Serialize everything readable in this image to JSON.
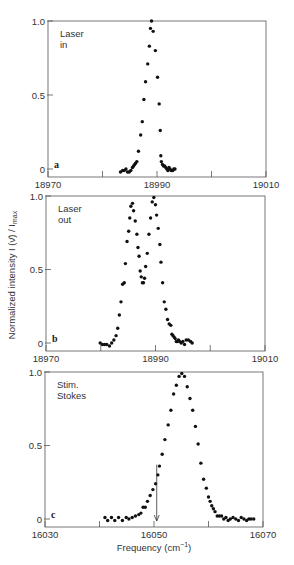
{
  "figure": {
    "ylabel": "Normalized intensity I (ν̄) / I",
    "ylabel_sub": "max",
    "xlabel": "Frequency (cm",
    "xlabel_sup": "−1",
    "xlabel_close": ")"
  },
  "chart_data": [
    {
      "type": "scatter",
      "panel": "a",
      "label_lines": [
        "Laser",
        "in"
      ],
      "xlim": [
        18970,
        19010
      ],
      "ylim": [
        0,
        1.0
      ],
      "xticks": [
        18970,
        18980,
        18990,
        19000,
        19010
      ],
      "xtick_labels": [
        "18970",
        "",
        "18990",
        "",
        "19010"
      ],
      "yticks": [
        0,
        0.5,
        1.0
      ],
      "ytick_labels": [
        "0",
        "0.5",
        "1.0"
      ],
      "frame": {
        "x": 48,
        "y": 21,
        "w": 218,
        "h": 156
      },
      "x": [
        18983.3,
        18983.7,
        18984.0,
        18984.3,
        18984.6,
        18984.9,
        18985.2,
        18985.5,
        18985.7,
        18985.9,
        18986.1,
        18986.3,
        18986.6,
        18987.0,
        18987.3,
        18987.6,
        18987.9,
        18988.3,
        18988.6,
        18988.8,
        18989.0,
        18989.3,
        18989.7,
        18990.1,
        18990.4,
        18990.6,
        18990.7,
        18990.8,
        18991.0,
        18991.2,
        18991.4,
        18991.6,
        18991.8,
        18992.0,
        18992.2,
        18992.4,
        18992.6,
        18992.9,
        18993.1,
        18993.3
      ],
      "y": [
        -0.02,
        -0.01,
        -0.01,
        0,
        -0.02,
        -0.02,
        -0.01,
        0.01,
        0.02,
        0.03,
        0.04,
        0.05,
        0.12,
        0.23,
        0.32,
        0.47,
        0.59,
        0.71,
        0.83,
        0.95,
        1.0,
        0.93,
        0.8,
        0.62,
        0.44,
        0.26,
        0.09,
        0.05,
        0.03,
        0.02,
        0.02,
        0.01,
        0.0,
        -0.01,
        0.01,
        0,
        -0.01,
        -0.01,
        0,
        0
      ],
      "title": "",
      "xlabel": "",
      "ylabel": ""
    },
    {
      "type": "scatter",
      "panel": "b",
      "label_lines": [
        "Laser",
        "out"
      ],
      "xlim": [
        18970,
        19010
      ],
      "ylim": [
        0,
        1.0
      ],
      "xticks": [
        18970,
        18980,
        18990,
        19000,
        19010
      ],
      "xtick_labels": [
        "18970",
        "",
        "18990",
        "",
        "19010"
      ],
      "yticks": [
        0,
        0.5,
        1.0
      ],
      "ytick_labels": [
        "0",
        "0.5",
        "1.0"
      ],
      "frame": {
        "x": 46,
        "y": 196,
        "w": 219,
        "h": 155
      },
      "x": [
        18979.9,
        18980.3,
        18980.7,
        18981.1,
        18981.6,
        18982.0,
        18982.4,
        18982.8,
        18983.1,
        18983.4,
        18983.7,
        18984.0,
        18984.3,
        18984.5,
        18984.8,
        18985.1,
        18985.3,
        18985.5,
        18985.8,
        18986.0,
        18986.3,
        18986.6,
        18986.8,
        18987.0,
        18987.2,
        18987.4,
        18987.6,
        18987.8,
        18988.0,
        18988.2,
        18988.5,
        18988.8,
        18989.1,
        18989.4,
        18989.7,
        18990.0,
        18990.2,
        18990.5,
        18990.8,
        18991.0,
        18991.3,
        18991.6,
        18991.9,
        18992.2,
        18992.5,
        18992.8,
        18993.0,
        18993.2,
        18993.4,
        18993.6,
        18993.8,
        18994.0,
        18994.2,
        18994.4,
        18994.7,
        18995.0,
        18995.3,
        18995.6,
        18996.0,
        18996.4,
        18996.7
      ],
      "y": [
        0,
        -0.01,
        -0.01,
        -0.01,
        -0.02,
        0,
        0.02,
        0.05,
        0.1,
        0.19,
        0.28,
        0.4,
        0.41,
        0.54,
        0.69,
        0.76,
        0.85,
        0.93,
        0.95,
        0.9,
        0.83,
        0.74,
        0.65,
        0.59,
        0.49,
        0.45,
        0.41,
        0.41,
        0.44,
        0.52,
        0.61,
        0.74,
        0.85,
        0.96,
        0.99,
        0.94,
        0.87,
        0.78,
        0.67,
        0.55,
        0.41,
        0.28,
        0.23,
        0.16,
        0.13,
        0.12,
        0.06,
        0.05,
        0.04,
        0.03,
        0.01,
        0.01,
        0.02,
        0.01,
        0.0,
        0.01,
        -0.01,
        0.02,
        0.02,
        0.01,
        0.0
      ],
      "title": "",
      "xlabel": "",
      "ylabel": ""
    },
    {
      "type": "scatter",
      "panel": "c",
      "label_lines": [
        "Stim.",
        "Stokes"
      ],
      "xlim": [
        16030,
        16070
      ],
      "ylim": [
        0,
        1.0
      ],
      "xticks": [
        16030,
        16040,
        16050,
        16060,
        16070
      ],
      "xtick_labels": [
        "16030",
        "",
        "16050",
        "",
        "16070"
      ],
      "yticks": [
        0,
        0.5,
        1.0
      ],
      "ytick_labels": [
        "0",
        "0.5",
        "1.0"
      ],
      "frame": {
        "x": 45,
        "y": 372,
        "w": 218,
        "h": 155
      },
      "x": [
        16041.0,
        16041.5,
        16042.2,
        16042.8,
        16043.5,
        16044.2,
        16044.9,
        16045.4,
        16046.0,
        16046.6,
        16047.2,
        16047.6,
        16048.0,
        16048.4,
        16048.8,
        16049.3,
        16049.8,
        16050.3,
        16050.7,
        16051.0,
        16051.5,
        16052.0,
        16052.6,
        16053.1,
        16053.6,
        16054.1,
        16054.6,
        16055.1,
        16055.6,
        16056.1,
        16056.6,
        16057.1,
        16057.6,
        16058.1,
        16058.6,
        16059.1,
        16059.6,
        16060.0,
        16060.3,
        16060.6,
        16060.9,
        16061.2,
        16061.6,
        16062.0,
        16062.4,
        16062.8,
        16063.2,
        16063.6,
        16064.0,
        16064.5,
        16065.0,
        16065.5,
        16066.0,
        16066.5,
        16067.0,
        16067.4,
        16067.8,
        16068.3
      ],
      "y": [
        0.01,
        -0.01,
        0.01,
        -0.01,
        0.01,
        -0.01,
        0.01,
        0,
        0.01,
        0.02,
        0.03,
        0.04,
        0.08,
        0.08,
        0.12,
        0.16,
        0.2,
        0.24,
        0.3,
        0.36,
        0.44,
        0.54,
        0.64,
        0.74,
        0.85,
        0.91,
        0.97,
        0.99,
        0.97,
        0.9,
        0.82,
        0.74,
        0.63,
        0.51,
        0.38,
        0.27,
        0.21,
        0.15,
        0.12,
        0.09,
        0.07,
        0.05,
        0.02,
        0.02,
        0.02,
        0,
        0.01,
        -0.01,
        0,
        0.01,
        0,
        -0.01,
        0.01,
        0,
        -0.01,
        0,
        0,
        0
      ],
      "arrow_x": 16050.5,
      "arrow_y_top": 0.37,
      "title": "",
      "xlabel": "Frequency (cm⁻¹)",
      "ylabel": ""
    }
  ]
}
